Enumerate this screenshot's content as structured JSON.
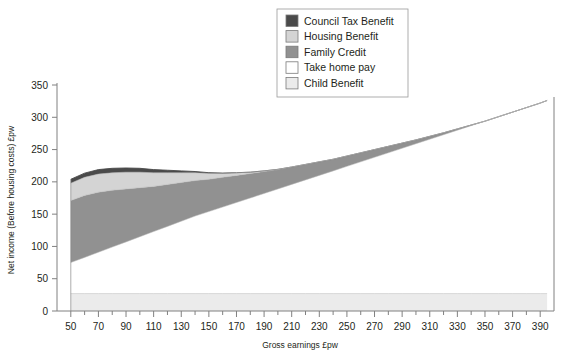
{
  "chart_data": {
    "type": "area",
    "stacked": true,
    "title": "",
    "xlabel": "Gross earnings £pw",
    "ylabel": "Net income (Before housing costs) £pw",
    "xlim": [
      40,
      400
    ],
    "ylim": [
      0,
      350
    ],
    "xticks": [
      50,
      70,
      90,
      110,
      130,
      150,
      170,
      190,
      210,
      230,
      250,
      270,
      290,
      310,
      330,
      350,
      370,
      390
    ],
    "xtick_labels": [
      "50",
      "70",
      "90",
      "110",
      "130",
      "150",
      "170",
      "190",
      "210",
      "230",
      "250",
      "270",
      "290",
      "310",
      "330",
      "350",
      "370",
      "390"
    ],
    "xtick_minor_step": 10,
    "yticks": [
      0,
      50,
      100,
      150,
      200,
      250,
      300,
      350
    ],
    "ytick_labels": [
      "0",
      "50",
      "100",
      "150",
      "200",
      "250",
      "300",
      "350"
    ],
    "grid": false,
    "legend_position": "top-center",
    "x": [
      50,
      60,
      70,
      80,
      90,
      100,
      110,
      120,
      130,
      140,
      150,
      160,
      170,
      180,
      190,
      200,
      210,
      220,
      230,
      240,
      250,
      260,
      270,
      280,
      290,
      300,
      310,
      320,
      330,
      340,
      350,
      360,
      370,
      380,
      390,
      395
    ],
    "series": [
      {
        "name": "Child Benefit",
        "color": "#ebebeb",
        "values": [
          27,
          27,
          27,
          27,
          27,
          27,
          27,
          27,
          27,
          27,
          27,
          27,
          27,
          27,
          27,
          27,
          27,
          27,
          27,
          27,
          27,
          27,
          27,
          27,
          27,
          27,
          27,
          27,
          27,
          27,
          27,
          27,
          27,
          27,
          27,
          27
        ]
      },
      {
        "name": "Take home pay",
        "color": "#ffffff",
        "values": [
          48,
          56,
          64,
          72,
          80,
          88,
          96,
          104,
          112,
          120,
          127,
          134,
          141,
          148,
          155,
          162,
          169,
          176,
          183,
          190,
          197,
          204,
          211,
          218,
          225,
          232,
          239,
          246,
          253,
          260,
          267,
          274,
          281,
          288,
          295,
          299
        ]
      },
      {
        "name": "Family Credit",
        "color": "#919191",
        "values": [
          96,
          96,
          93,
          88,
          82,
          76,
          70,
          65,
          60,
          55,
          50,
          46,
          42,
          38,
          34,
          30,
          27,
          24,
          21,
          18,
          16,
          14,
          12,
          10,
          8,
          6,
          4.5,
          3,
          2,
          1,
          0,
          0,
          0,
          0,
          0,
          0
        ]
      },
      {
        "name": "Housing Benefit",
        "color": "#d4d4d4",
        "values": [
          27,
          28,
          28,
          27,
          26,
          24,
          21,
          18,
          15,
          12,
          9,
          6,
          4,
          2,
          1,
          0.4,
          0,
          0,
          0,
          0,
          0,
          0,
          0,
          0,
          0,
          0,
          0,
          0,
          0,
          0,
          0,
          0,
          0,
          0,
          0,
          0
        ]
      },
      {
        "name": "Council Tax Benefit",
        "color": "#4a4a4a",
        "values": [
          6,
          6.5,
          7,
          7,
          6.5,
          6,
          5,
          4,
          3,
          2,
          1.2,
          0.6,
          0.2,
          0,
          0,
          0,
          0,
          0,
          0,
          0,
          0,
          0,
          0,
          0,
          0,
          0,
          0,
          0,
          0,
          0,
          0,
          0,
          0,
          0,
          0,
          0
        ]
      }
    ],
    "legend_entries": [
      {
        "label": "Council Tax Benefit",
        "color": "#4a4a4a"
      },
      {
        "label": "Housing Benefit",
        "color": "#d4d4d4"
      },
      {
        "label": "Family Credit",
        "color": "#919191"
      },
      {
        "label": "Take home pay",
        "color": "#ffffff"
      },
      {
        "label": "Child Benefit",
        "color": "#ebebeb"
      }
    ]
  },
  "axes": {
    "x_title": "Gross earnings £pw",
    "y_title": "Net income (Before housing costs) £pw"
  }
}
